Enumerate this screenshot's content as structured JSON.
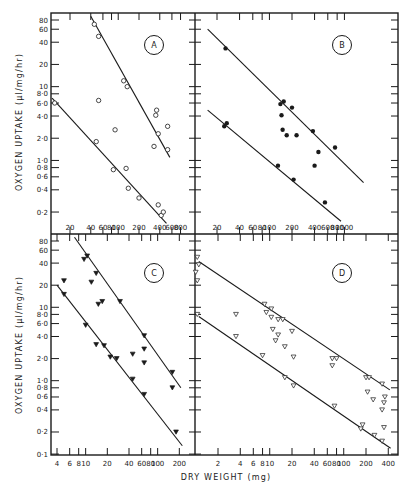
{
  "figure": {
    "xlabel": "DRY WEIGHT (mg)",
    "ylabel_top": "OXYGEN UPTAKE (µl/mg/hr)",
    "ylabel_bottom": "OXYGEN UPTAKE (µl/mg/hr)",
    "colors": {
      "ink": "#1a1a1a",
      "background": "#ffffff"
    }
  },
  "chart_data": [
    {
      "type": "scatter",
      "panel": "A",
      "title": "A",
      "xscale": "log",
      "yscale": "log",
      "xlabel": "DRY WEIGHT (mg)",
      "ylabel": "OXYGEN UPTAKE (µl/mg/hr)",
      "xticks": [
        20,
        40,
        60,
        80,
        100,
        200,
        400,
        600,
        800
      ],
      "yticks": [
        0.2,
        0.4,
        0.6,
        0.8,
        1.0,
        2.0,
        4.0,
        6.0,
        8.0,
        10,
        20,
        40,
        60,
        80
      ],
      "ytick_labels": [
        "0·2",
        "0·4",
        "0·6",
        "0·8",
        "1·0",
        "2·0",
        "4·0",
        "6·0",
        "8·0",
        "10",
        "20",
        "40",
        "60",
        "80"
      ],
      "marker": "open-circle",
      "series": [
        {
          "name": "upper",
          "points": [
            [
              45,
              70
            ],
            [
              52,
              48
            ],
            [
              120,
              12
            ],
            [
              135,
              10
            ],
            [
              360,
              4.8
            ],
            [
              350,
              4.1
            ],
            [
              520,
              2.9
            ],
            [
              380,
              2.3
            ],
            [
              330,
              1.55
            ],
            [
              520,
              1.4
            ],
            [
              52,
              6.5
            ],
            [
              90,
              2.6
            ]
          ],
          "fit_line": [
            [
              40,
              90
            ],
            [
              560,
              1.1
            ]
          ]
        },
        {
          "name": "lower",
          "points": [
            [
              12,
              6.0
            ],
            [
              48,
              1.8
            ],
            [
              85,
              0.75
            ],
            [
              130,
              0.78
            ],
            [
              140,
              0.42
            ],
            [
              200,
              0.31
            ],
            [
              380,
              0.25
            ],
            [
              420,
              0.18
            ],
            [
              450,
              0.2
            ]
          ],
          "fit_line": [
            [
              11,
              7.0
            ],
            [
              500,
              0.14
            ]
          ]
        }
      ]
    },
    {
      "type": "scatter",
      "panel": "B",
      "title": "B",
      "xscale": "log",
      "yscale": "log",
      "xticks": [
        20,
        40,
        60,
        80,
        100,
        200,
        400,
        600,
        800,
        1000
      ],
      "marker": "filled-circle",
      "series": [
        {
          "name": "upper",
          "points": [
            [
              26,
              33
            ],
            [
              140,
              5.8
            ],
            [
              155,
              6.3
            ],
            [
              200,
              5.2
            ],
            [
              145,
              4.1
            ],
            [
              150,
              2.6
            ],
            [
              170,
              2.2
            ],
            [
              230,
              2.2
            ],
            [
              380,
              2.5
            ],
            [
              750,
              1.5
            ],
            [
              450,
              1.3
            ],
            [
              400,
              0.85
            ]
          ],
          "fit_line": [
            [
              15,
              60
            ],
            [
              1800,
              0.5
            ]
          ]
        },
        {
          "name": "lower",
          "points": [
            [
              25,
              2.9
            ],
            [
              27,
              3.2
            ],
            [
              130,
              0.85
            ],
            [
              210,
              0.55
            ],
            [
              550,
              0.27
            ]
          ],
          "fit_line": [
            [
              15,
              4.8
            ],
            [
              900,
              0.15
            ]
          ]
        }
      ]
    },
    {
      "type": "scatter",
      "panel": "C",
      "title": "C",
      "xscale": "log",
      "yscale": "log",
      "xticks": [
        4,
        6,
        8,
        10,
        20,
        40,
        60,
        80,
        100,
        200
      ],
      "yticks": [
        0.1,
        0.2,
        0.4,
        0.6,
        0.8,
        1.0,
        2.0,
        4.0,
        6.0,
        8.0,
        10,
        20,
        40,
        60,
        80
      ],
      "ytick_labels": [
        "0·1",
        "0·2",
        "0·4",
        "0·6",
        "0·8",
        "1·0",
        "2·0",
        "4·0",
        "6·0",
        "8·0",
        "10",
        "20",
        "40",
        "60",
        "80"
      ],
      "marker": "filled-triangle-down",
      "series": [
        {
          "name": "upper",
          "points": [
            [
              9.5,
              45
            ],
            [
              10.5,
              50
            ],
            [
              12,
              22
            ],
            [
              14,
              29
            ],
            [
              15,
              11
            ],
            [
              17,
              12
            ],
            [
              30,
              12
            ],
            [
              65,
              4.1
            ],
            [
              65,
              2.7
            ],
            [
              65,
              1.75
            ],
            [
              45,
              2.3
            ],
            [
              160,
              1.3
            ],
            [
              160,
              0.8
            ]
          ],
          "fit_line": [
            [
              7,
              90
            ],
            [
              210,
              0.8
            ]
          ]
        },
        {
          "name": "lower",
          "points": [
            [
              5,
              23
            ],
            [
              5,
              15
            ],
            [
              10,
              5.7
            ],
            [
              14,
              3.1
            ],
            [
              18,
              3.0
            ],
            [
              22,
              2.1
            ],
            [
              27,
              2.0
            ],
            [
              45,
              1.05
            ],
            [
              65,
              0.65
            ],
            [
              180,
              0.2
            ]
          ],
          "fit_line": [
            [
              4,
              20
            ],
            [
              220,
              0.13
            ]
          ]
        }
      ]
    },
    {
      "type": "scatter",
      "panel": "D",
      "title": "D",
      "xscale": "log",
      "yscale": "log",
      "xticks": [
        2,
        4,
        6,
        8,
        10,
        20,
        40,
        60,
        80,
        100,
        200,
        400
      ],
      "marker": "open-triangle-down",
      "series": [
        {
          "name": "upper",
          "points": [
            [
              1.05,
              48
            ],
            [
              1.1,
              38
            ],
            [
              1.0,
              30
            ],
            [
              1.05,
              23
            ],
            [
              8.5,
              11
            ],
            [
              10.5,
              9.5
            ],
            [
              9,
              8.5
            ],
            [
              10.5,
              7.3
            ],
            [
              13,
              6.8
            ],
            [
              15,
              6.8
            ],
            [
              11,
              5.0
            ],
            [
              13,
              4.2
            ],
            [
              12,
              3.5
            ],
            [
              16,
              2.9
            ],
            [
              20,
              4.7
            ],
            [
              21,
              2.1
            ],
            [
              70,
              2.0
            ],
            [
              80,
              2.0
            ],
            [
              70,
              1.6
            ],
            [
              200,
              1.1
            ],
            [
              220,
              1.1
            ],
            [
              330,
              0.9
            ],
            [
              210,
              0.7
            ],
            [
              250,
              0.55
            ],
            [
              360,
              0.6
            ],
            [
              350,
              0.5
            ],
            [
              330,
              0.4
            ]
          ],
          "fit_line": [
            [
              1.1,
              42
            ],
            [
              420,
              0.75
            ]
          ]
        },
        {
          "name": "lower",
          "points": [
            [
              1.05,
              8.0
            ],
            [
              3.5,
              8.0
            ],
            [
              3.5,
              4.0
            ],
            [
              8,
              2.2
            ],
            [
              16,
              1.1
            ],
            [
              21,
              0.85
            ],
            [
              75,
              0.45
            ],
            [
              170,
              0.22
            ],
            [
              180,
              0.25
            ],
            [
              260,
              0.18
            ],
            [
              330,
              0.15
            ],
            [
              350,
              0.23
            ]
          ],
          "fit_line": [
            [
              1.1,
              7.5
            ],
            [
              430,
              0.12
            ]
          ]
        }
      ]
    }
  ],
  "panels": {
    "A": {
      "letter": "A"
    },
    "B": {
      "letter": "B"
    },
    "C": {
      "letter": "C"
    },
    "D": {
      "letter": "D"
    }
  }
}
